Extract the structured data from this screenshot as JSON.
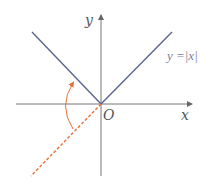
{
  "diagram": {
    "function_label": "y =|x|",
    "axis_labels": {
      "x": "x",
      "y": "y",
      "origin": "O"
    },
    "colors": {
      "axis": "#666666",
      "graph": "#5a6490",
      "reflection": "#e8703a"
    },
    "elements": [
      {
        "type": "axis",
        "name": "x-axis"
      },
      {
        "type": "axis",
        "name": "y-axis"
      },
      {
        "type": "line",
        "name": "y=|x| left branch"
      },
      {
        "type": "line",
        "name": "y=|x| right branch"
      },
      {
        "type": "dashed-line",
        "name": "reflected branch y=x (x<0)"
      },
      {
        "type": "arc-arrow",
        "name": "reflection arrow"
      }
    ]
  }
}
